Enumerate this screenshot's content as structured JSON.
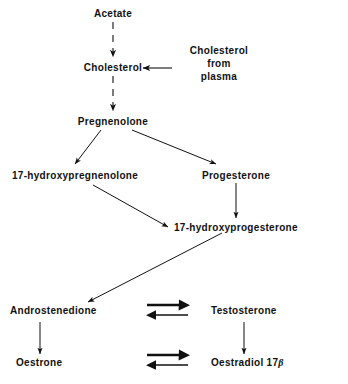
{
  "diagram": {
    "background_color": "#ffffff",
    "text_color": "#111111",
    "nodes": {
      "acetate": "Acetate",
      "cholesterol": "Cholesterol",
      "cholesterol_from_plasma_line1": "Cholesterol",
      "cholesterol_from_plasma_line2": "from",
      "cholesterol_from_plasma_line3": "plasma",
      "pregnenolone": "Pregnenolone",
      "hydroxypregnenolone": "17-hydroxypregnenolone",
      "progesterone": "Progesterone",
      "hydroxyprogesterone": "17-hydroxyprogesterone",
      "androstenedione": "Androstenedione",
      "testosterone": "Testosterone",
      "oestrone": "Oestrone",
      "oestradiol_main": "Oestradiol 17",
      "oestradiol_beta": "β"
    },
    "edges": [
      {
        "name": "acetate-to-cholesterol",
        "from": "Acetate",
        "to": "Cholesterol",
        "style": "dashed",
        "direction": "down"
      },
      {
        "name": "plasma-to-cholesterol",
        "from": "Cholesterol from plasma",
        "to": "Cholesterol",
        "style": "solid",
        "direction": "left"
      },
      {
        "name": "cholesterol-to-pregnenolone",
        "from": "Cholesterol",
        "to": "Pregnenolone",
        "style": "dashed",
        "direction": "down"
      },
      {
        "name": "pregnenolone-to-hydroxypregnenolone",
        "from": "Pregnenolone",
        "to": "17-hydroxypregnenolone",
        "style": "solid",
        "direction": "down-left"
      },
      {
        "name": "pregnenolone-to-progesterone",
        "from": "Pregnenolone",
        "to": "Progesterone",
        "style": "solid",
        "direction": "down-right"
      },
      {
        "name": "hydroxypregnenolone-to-hydroxyprogesterone",
        "from": "17-hydroxypregnenolone",
        "to": "17-hydroxyprogesterone",
        "style": "solid",
        "direction": "down-right"
      },
      {
        "name": "progesterone-to-hydroxyprogesterone",
        "from": "Progesterone",
        "to": "17-hydroxyprogesterone",
        "style": "solid",
        "direction": "down"
      },
      {
        "name": "hydroxyprogesterone-to-androstenedione",
        "from": "17-hydroxyprogesterone",
        "to": "Androstenedione",
        "style": "solid",
        "direction": "down-left"
      },
      {
        "name": "androstenedione-to-oestrone",
        "from": "Androstenedione",
        "to": "Oestrone",
        "style": "solid",
        "direction": "down"
      },
      {
        "name": "testosterone-to-oestradiol",
        "from": "Testosterone",
        "to": "Oestradiol 17β",
        "style": "solid",
        "direction": "down"
      },
      {
        "name": "androstenedione-testosterone-equilibrium",
        "from": "Androstenedione",
        "to": "Testosterone",
        "style": "equilibrium",
        "direction": "both"
      },
      {
        "name": "oestrone-oestradiol-equilibrium",
        "from": "Oestrone",
        "to": "Oestradiol 17β",
        "style": "equilibrium",
        "direction": "both"
      }
    ]
  }
}
